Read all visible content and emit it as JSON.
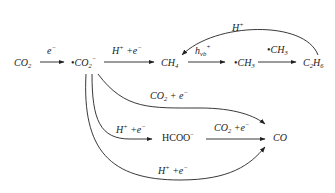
{
  "diagram": {
    "nodes": {
      "co2": {
        "base": "CO",
        "sub": "2"
      },
      "co2_radical": {
        "dot": "•",
        "base": "CO",
        "sub": "2",
        "sup": "−"
      },
      "ch4": {
        "base": "CH",
        "sub": "4"
      },
      "ch3_radical": {
        "dot": "•",
        "base": "CH",
        "sub": "3"
      },
      "c2h6": {
        "base1": "C",
        "sub1": "2",
        "base2": "H",
        "sub2": "6"
      },
      "hcoo": {
        "base": "HCOO",
        "sup": "−"
      },
      "co": {
        "base": "CO"
      }
    },
    "edges": {
      "co2_to_radical": {
        "base": "e",
        "sup": "−"
      },
      "radical_to_ch4": {
        "base1": "H",
        "sup1": "+",
        "mid": " +e",
        "sup2": "−"
      },
      "ch4_to_ch3": {
        "base": "h",
        "sub": "vb",
        "sup": "+"
      },
      "ch3_to_c2h6": {
        "dot": "•",
        "base": "CH",
        "sub": "3"
      },
      "c2h6_to_ch4": {
        "base": "H",
        "sup": "+"
      },
      "radical_to_co_top": {
        "base": "CO",
        "sub": "2",
        "mid": " + e",
        "sup": "−"
      },
      "radical_to_hcoo": {
        "base1": "H",
        "sup1": "+",
        "mid": " +e",
        "sup2": "−"
      },
      "hcoo_to_co": {
        "base": "CO",
        "sub": "2",
        "mid": " +e",
        "sup": "−"
      },
      "radical_to_co_bottom": {
        "base1": "H",
        "sup1": "+",
        "mid": " +e",
        "sup2": "−"
      }
    }
  }
}
